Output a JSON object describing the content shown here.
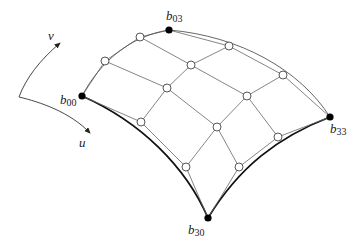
{
  "labels": {
    "u_axis": "u",
    "v_axis": "v",
    "b00": {
      "base": "b",
      "sub": "00"
    },
    "b03": {
      "base": "b",
      "sub": "03"
    },
    "b30": {
      "base": "b",
      "sub": "30"
    },
    "b33": {
      "base": "b",
      "sub": "33"
    }
  },
  "control_points": {
    "b00": [
      82,
      96
    ],
    "b01": [
      105,
      61
    ],
    "b02": [
      140,
      37
    ],
    "b03": [
      169,
      30
    ],
    "b10": [
      141,
      122
    ],
    "b11": [
      167,
      88
    ],
    "b12": [
      191,
      65
    ],
    "b13": [
      229,
      46
    ],
    "b20": [
      186,
      167
    ],
    "b21": [
      217,
      127
    ],
    "b22": [
      247,
      96
    ],
    "b23": [
      283,
      75
    ],
    "b30": [
      208,
      218
    ],
    "b31": [
      239,
      167
    ],
    "b32": [
      278,
      137
    ],
    "b33": [
      330,
      117
    ]
  },
  "corner_points": [
    "b00",
    "b03",
    "b30",
    "b33"
  ],
  "colors": {
    "line": "#555555",
    "boundary": "#111111",
    "corner": "#000000",
    "open_point": "#ffffff"
  }
}
